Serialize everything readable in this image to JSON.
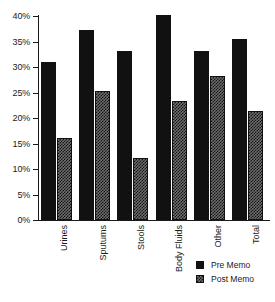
{
  "chart_data": {
    "type": "bar",
    "title": "",
    "subtitle": "",
    "xlabel": "",
    "ylabel": "",
    "ylim": [
      0,
      40
    ],
    "ytick_labels": [
      "40%",
      "35%",
      "30%",
      "25%",
      "20%",
      "15%",
      "10%",
      "5%",
      "0%"
    ],
    "ytick_values": [
      40,
      35,
      30,
      25,
      20,
      15,
      10,
      5,
      0
    ],
    "grid": false,
    "legend_position": "bottom-right",
    "value_suffix": "%",
    "categories": [
      "Urines",
      "Sputums",
      "Stools",
      "Body Fluids",
      "Other",
      "Total"
    ],
    "series": [
      {
        "name": "Pre Memo",
        "color": "#111111",
        "pattern": "solid",
        "values": [
          31.0,
          37.2,
          33.1,
          40.2,
          33.2,
          35.4
        ]
      },
      {
        "name": "Post Memo",
        "color": "#6e6e6e",
        "pattern": "checker",
        "values": [
          16.1,
          25.3,
          12.2,
          23.3,
          28.3,
          21.4
        ]
      }
    ]
  },
  "legend": {
    "entries": [
      {
        "label": "Pre Memo"
      },
      {
        "label": "Post Memo"
      }
    ]
  }
}
